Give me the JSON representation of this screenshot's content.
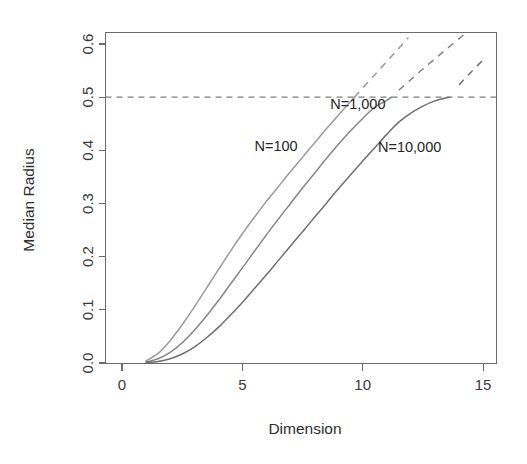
{
  "chart_data": {
    "type": "line",
    "title": "",
    "subtitle": "",
    "xlabel": "Dimension",
    "ylabel": "Median Radius",
    "xlim": [
      0,
      15.6
    ],
    "ylim": [
      0.0,
      0.63
    ],
    "xticks": [
      0,
      5,
      10,
      15
    ],
    "xticklabels": [
      "0",
      "5",
      "10",
      "15"
    ],
    "yticks": [
      0.0,
      0.1,
      0.2,
      0.3,
      0.4,
      0.5,
      0.6
    ],
    "yticklabels": [
      "0.0",
      "0.1",
      "0.2",
      "0.3",
      "0.4",
      "0.5",
      "0.6"
    ],
    "grid": false,
    "legend": "inline-annotations",
    "box": true,
    "reference_lines": [
      {
        "name": "median-half-line",
        "orientation": "horizontal",
        "value": 0.5,
        "style": "dashed",
        "color": "#7d7d7d"
      }
    ],
    "x": [
      1,
      2,
      3,
      4,
      5,
      6,
      7,
      8,
      9,
      10,
      11,
      12,
      13,
      14,
      15
    ],
    "series": [
      {
        "name": "N=100",
        "label": "N=100",
        "color": "#9a9a9a",
        "solid_until_y": 0.5,
        "crosses_half_at_x": 8.7,
        "values": [
          0.0043,
          0.0567,
          0.1225,
          0.1803,
          0.2282,
          0.268,
          0.3016,
          0.3304,
          0.3554,
          0.3774,
          0.3968,
          0.4142,
          0.4298,
          0.444,
          0.4569
        ],
        "extrapolated_values": [
          0.0043,
          0.0567,
          0.1225,
          0.1803,
          0.2282,
          0.268,
          0.3016,
          0.3304,
          0.3554,
          0.3774,
          0.3968,
          0.4142,
          0.4298,
          0.444,
          0.4569
        ],
        "label_position": {
          "x": 6.4,
          "y": 0.398
        }
      },
      {
        "name": "N=1,000",
        "label": "N=1,000",
        "color": "#858585",
        "solid_until_y": 0.5,
        "crosses_half_at_x": 11.2,
        "values": [
          0.0007,
          0.0186,
          0.0595,
          0.1031,
          0.1436,
          0.1797,
          0.2115,
          0.2396,
          0.2646,
          0.287,
          0.3071,
          0.3254,
          0.342,
          0.3573,
          0.3713
        ],
        "label_position": {
          "x": 9.8,
          "y": 0.478
        }
      },
      {
        "name": "N=10,000",
        "label": "N=10,000",
        "color": "#6f6f6f",
        "solid_until_y": 0.5,
        "crosses_half_at_x": 13.6,
        "values": [
          0.0001,
          0.0055,
          0.0264,
          0.0545,
          0.0841,
          0.1126,
          0.139,
          0.1632,
          0.1853,
          0.2054,
          0.2238,
          0.2407,
          0.2562,
          0.2706,
          0.2839
        ],
        "label_position": {
          "x": 11.95,
          "y": 0.397
        }
      }
    ],
    "curve_path_points": {
      "note": "Pixel-read control points (dimension, median radius) traced from the plotted curves",
      "N=100": [
        [
          1,
          0.004
        ],
        [
          1.5,
          0.018
        ],
        [
          2,
          0.042
        ],
        [
          2.5,
          0.072
        ],
        [
          3,
          0.105
        ],
        [
          3.5,
          0.14
        ],
        [
          4,
          0.175
        ],
        [
          4.5,
          0.21
        ],
        [
          5,
          0.243
        ],
        [
          5.5,
          0.274
        ],
        [
          6,
          0.304
        ],
        [
          6.5,
          0.332
        ],
        [
          7,
          0.36
        ],
        [
          7.5,
          0.387
        ],
        [
          8,
          0.414
        ],
        [
          8.5,
          0.441
        ],
        [
          8.7,
          0.451
        ],
        [
          9,
          0.467
        ],
        [
          9.5,
          0.492
        ],
        [
          10,
          0.517
        ],
        [
          10.5,
          0.542
        ],
        [
          11,
          0.567
        ],
        [
          11.5,
          0.592
        ],
        [
          11.9,
          0.612
        ]
      ],
      "N=1,000": [
        [
          1,
          0.002
        ],
        [
          1.5,
          0.008
        ],
        [
          2,
          0.02
        ],
        [
          2.5,
          0.038
        ],
        [
          3,
          0.061
        ],
        [
          3.5,
          0.088
        ],
        [
          4,
          0.117
        ],
        [
          4.5,
          0.148
        ],
        [
          5,
          0.179
        ],
        [
          5.5,
          0.21
        ],
        [
          6,
          0.241
        ],
        [
          6.5,
          0.271
        ],
        [
          7,
          0.3
        ],
        [
          7.5,
          0.329
        ],
        [
          8,
          0.357
        ],
        [
          8.5,
          0.385
        ],
        [
          9,
          0.412
        ],
        [
          9.5,
          0.437
        ],
        [
          10,
          0.46
        ],
        [
          10.5,
          0.481
        ],
        [
          11,
          0.494
        ],
        [
          11.2,
          0.5
        ],
        [
          11.5,
          0.513
        ],
        [
          12,
          0.533
        ],
        [
          12.5,
          0.553
        ],
        [
          13,
          0.572
        ],
        [
          13.5,
          0.591
        ],
        [
          14,
          0.61
        ],
        [
          14.3,
          0.621
        ]
      ],
      "N=10,000": [
        [
          1,
          0.001
        ],
        [
          1.5,
          0.003
        ],
        [
          2,
          0.008
        ],
        [
          2.5,
          0.017
        ],
        [
          3,
          0.03
        ],
        [
          3.5,
          0.047
        ],
        [
          4,
          0.067
        ],
        [
          4.5,
          0.09
        ],
        [
          5,
          0.114
        ],
        [
          5.5,
          0.14
        ],
        [
          6,
          0.166
        ],
        [
          6.5,
          0.193
        ],
        [
          7,
          0.22
        ],
        [
          7.5,
          0.247
        ],
        [
          8,
          0.274
        ],
        [
          8.5,
          0.301
        ],
        [
          9,
          0.328
        ],
        [
          9.5,
          0.354
        ],
        [
          10,
          0.38
        ],
        [
          10.5,
          0.405
        ],
        [
          11,
          0.43
        ],
        [
          11.5,
          0.453
        ],
        [
          12,
          0.47
        ],
        [
          12.5,
          0.483
        ],
        [
          13,
          0.493
        ],
        [
          13.6,
          0.5
        ],
        [
          14,
          0.523
        ],
        [
          14.5,
          0.547
        ],
        [
          15,
          0.57
        ]
      ]
    }
  },
  "figure": {
    "background_color": "#ffffff",
    "axis_color": "#6b6b6b",
    "text_color": "#2e2e2e"
  }
}
